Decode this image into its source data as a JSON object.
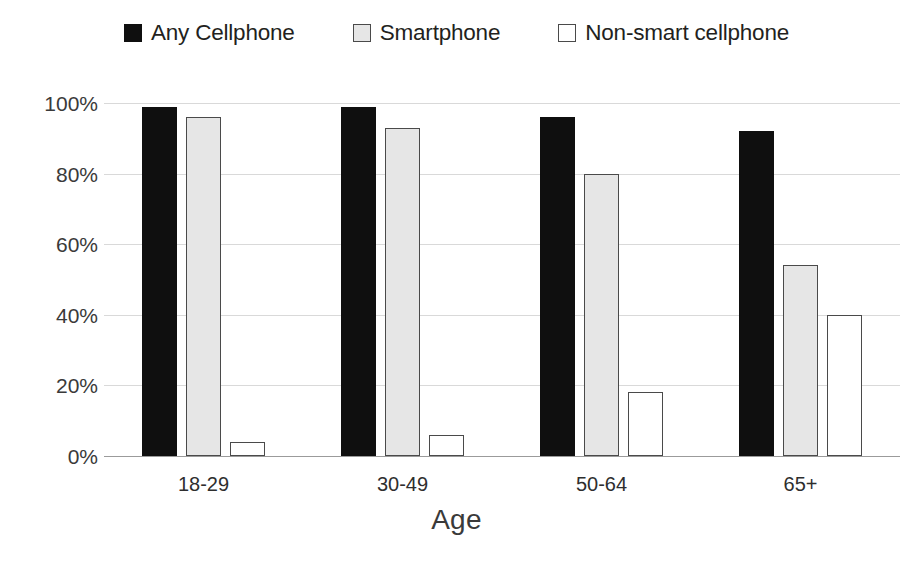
{
  "chart_data": {
    "type": "bar",
    "title": "",
    "subtitle": "",
    "xlabel": "Age",
    "ylabel": "",
    "categories": [
      "18-29",
      "30-49",
      "50-64",
      "65+"
    ],
    "series": [
      {
        "name": "Any Cellphone",
        "marker": "filled-square",
        "color": "#0f0f0f",
        "values": [
          99,
          99,
          96,
          92
        ]
      },
      {
        "name": "Smartphone",
        "marker": "light-square",
        "color": "#e6e6e6",
        "values": [
          96,
          93,
          80,
          54
        ]
      },
      {
        "name": "Non-smart cellphone",
        "marker": "open-square",
        "color": "#ffffff",
        "values": [
          4,
          6,
          18,
          40
        ]
      }
    ],
    "ylim": [
      0,
      100
    ],
    "y_ticks": [
      100,
      80,
      60,
      40,
      20,
      0
    ],
    "y_tick_labels": [
      "100%",
      "80%",
      "60%",
      "40%",
      "20%",
      "0%"
    ],
    "grid": true,
    "grid_axis": "y",
    "legend_position": "top-center",
    "value_unit": "%"
  },
  "legend": {
    "items": [
      {
        "label": "Any Cellphone",
        "swatch": "filled-square-swatch"
      },
      {
        "label": "Smartphone",
        "swatch": "light-gray-square-swatch"
      },
      {
        "label": "Non-smart cellphone",
        "swatch": "open-square-swatch"
      }
    ]
  },
  "axes": {
    "x_title": "Age",
    "x_tick_labels": [
      "18-29",
      "30-49",
      "50-64",
      "65+"
    ],
    "y_tick_labels": [
      "100%",
      "80%",
      "60%",
      "40%",
      "20%",
      "0%"
    ]
  },
  "colors": {
    "series_any_cellphone": "#0f0f0f",
    "series_smartphone": "#e6e6e6",
    "series_non_smart": "#ffffff",
    "bar_outline": "#4a4a4a",
    "gridline": "#d9d9d9",
    "axis_line": "#9b9b9b",
    "text": "#231f20",
    "background": "#ffffff"
  }
}
